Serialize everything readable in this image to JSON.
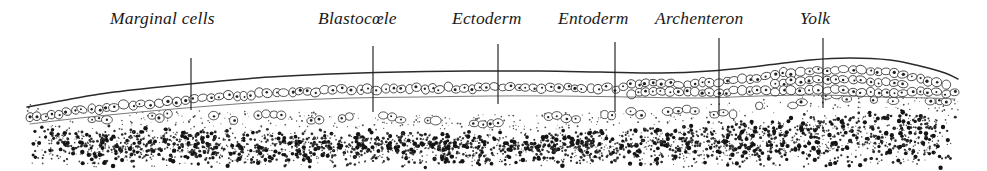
{
  "figure": {
    "background_color": "#ffffff",
    "ink_color": "#1f1f1f",
    "width": 987,
    "height": 171
  },
  "labels": [
    {
      "id": "marginal-cells",
      "text": "Marginal cells",
      "x": 110,
      "y": 10,
      "leader": {
        "x": 191,
        "y1": 58,
        "y2": 110
      }
    },
    {
      "id": "blastocoele",
      "text": "Blastocœle",
      "x": 318,
      "y": 10,
      "leader": {
        "x": 373,
        "y1": 46,
        "y2": 112
      }
    },
    {
      "id": "ectoderm",
      "text": "Ectoderm",
      "x": 452,
      "y": 10,
      "leader": {
        "x": 498,
        "y1": 44,
        "y2": 104
      }
    },
    {
      "id": "entoderm",
      "text": "Entoderm",
      "x": 558,
      "y": 10,
      "leader": {
        "x": 615,
        "y1": 42,
        "y2": 112
      }
    },
    {
      "id": "archenteron",
      "text": "Archenteron",
      "x": 655,
      "y": 10,
      "leader": {
        "x": 719,
        "y1": 38,
        "y2": 115
      }
    },
    {
      "id": "yolk",
      "text": "Yolk",
      "x": 800,
      "y": 10,
      "leader": {
        "x": 823,
        "y1": 38,
        "y2": 108
      }
    }
  ],
  "structures": {
    "membrane": {
      "name": "outer-membrane",
      "description": "thin outer surface line of the embryo",
      "points": [
        [
          27,
          107
        ],
        [
          60,
          101
        ],
        [
          100,
          94
        ],
        [
          150,
          88
        ],
        [
          210,
          82
        ],
        [
          270,
          77
        ],
        [
          330,
          74
        ],
        [
          400,
          72
        ],
        [
          470,
          71
        ],
        [
          540,
          71
        ],
        [
          600,
          72
        ],
        [
          660,
          73
        ],
        [
          710,
          71
        ],
        [
          760,
          66
        ],
        [
          810,
          60
        ],
        [
          850,
          58
        ],
        [
          890,
          60
        ],
        [
          920,
          66
        ],
        [
          945,
          73
        ],
        [
          958,
          79
        ]
      ]
    },
    "ectoderm_layer": {
      "name": "ectoderm-cell-layer",
      "description": "single to multiple rows of outlined cells beneath the membrane",
      "top_points": [
        [
          30,
          112
        ],
        [
          80,
          104
        ],
        [
          140,
          96
        ],
        [
          210,
          89
        ],
        [
          280,
          84
        ],
        [
          350,
          81
        ],
        [
          420,
          80
        ],
        [
          490,
          79
        ],
        [
          560,
          79
        ],
        [
          630,
          80
        ],
        [
          700,
          78
        ],
        [
          760,
          71
        ],
        [
          820,
          65
        ],
        [
          880,
          66
        ],
        [
          930,
          75
        ],
        [
          955,
          84
        ]
      ],
      "bottom_points": [
        [
          30,
          124
        ],
        [
          80,
          118
        ],
        [
          140,
          112
        ],
        [
          210,
          106
        ],
        [
          280,
          101
        ],
        [
          350,
          98
        ],
        [
          420,
          97
        ],
        [
          490,
          96
        ],
        [
          560,
          96
        ],
        [
          630,
          97
        ],
        [
          700,
          98
        ],
        [
          760,
          96
        ],
        [
          820,
          95
        ],
        [
          880,
          97
        ],
        [
          930,
          98
        ],
        [
          955,
          99
        ]
      ]
    },
    "blastocoele": {
      "name": "blastocoele-cavity",
      "description": "clear fluid-filled cavity between ectoderm and entoderm"
    },
    "entoderm_cells": {
      "name": "entoderm-scattered-cells",
      "description": "row of loose scattered cells lining the cavity floor"
    },
    "yolk_mass": {
      "name": "yolk-stipple-mass",
      "description": "dense stippled granular yolk filling the lower portion",
      "top_points": [
        [
          27,
          120
        ],
        [
          80,
          124
        ],
        [
          150,
          126
        ],
        [
          220,
          127
        ],
        [
          300,
          128
        ],
        [
          380,
          129
        ],
        [
          450,
          130
        ],
        [
          520,
          130
        ],
        [
          600,
          128
        ],
        [
          680,
          124
        ],
        [
          750,
          116
        ],
        [
          820,
          110
        ],
        [
          880,
          108
        ],
        [
          930,
          110
        ],
        [
          958,
          114
        ]
      ],
      "bottom_y": 168
    }
  }
}
